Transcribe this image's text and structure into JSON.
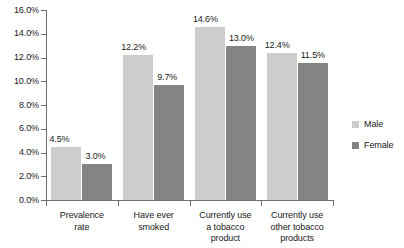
{
  "chart_data": {
    "type": "bar",
    "title": "",
    "subtitle": "",
    "xlabel": "",
    "ylabel": "",
    "ylim": [
      0,
      16
    ],
    "grid": false,
    "legend_position": "right",
    "y_ticks": [
      "0.0%",
      "2.0%",
      "4.0%",
      "6.0%",
      "8.0%",
      "10.0%",
      "12.0%",
      "14.0%",
      "16.0%"
    ],
    "categories": [
      "Prevalence rate",
      "Have ever smoked",
      "Currently use a tobacco product",
      "Currently use other tobacco products"
    ],
    "category_lines": [
      [
        "Prevalence",
        "rate"
      ],
      [
        "Have ever",
        "smoked"
      ],
      [
        "Currently use",
        "a tobacco",
        "product"
      ],
      [
        "Currently use",
        "other tobacco",
        "products"
      ]
    ],
    "series": [
      {
        "name": "Male",
        "color": "#cdcdcd",
        "values": [
          4.5,
          12.2,
          14.6,
          12.4
        ],
        "labels": [
          "4.5%",
          "12.2%",
          "14.6%",
          "12.4%"
        ]
      },
      {
        "name": "Female",
        "color": "#848484",
        "values": [
          3.0,
          9.7,
          13.0,
          11.5
        ],
        "labels": [
          "3.0%",
          "9.7%",
          "13.0%",
          "11.5%"
        ]
      }
    ]
  },
  "legend": {
    "items": [
      {
        "label": "Male",
        "color": "#cdcdcd"
      },
      {
        "label": "Female",
        "color": "#848484"
      }
    ]
  },
  "axis": {
    "y_ticks": [
      "16.0%",
      "14.0%",
      "12.0%",
      "10.0%",
      "8.0%",
      "6.0%",
      "4.0%",
      "2.0%",
      "0.0%"
    ]
  }
}
